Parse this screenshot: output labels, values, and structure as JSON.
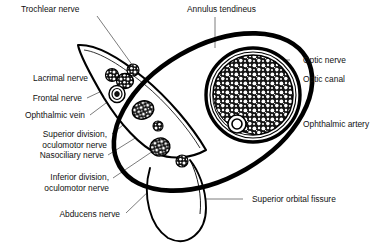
{
  "figure": {
    "type": "anatomical-cross-section-diagram",
    "colors": {
      "outline": "#000000",
      "leader_line": "#555555",
      "text": "#111111",
      "background": "#ffffff",
      "fill_stipple": "#1a1a1a"
    }
  },
  "labels": {
    "trochlear_nerve": "Trochlear nerve",
    "annulus_tendineus": "Annulus tendineus",
    "optic_nerve": "Optic nerve",
    "optic_canal": "Optic canal",
    "ophthalmic_artery": "Ophthalmic artery",
    "lacrimal_nerve": "Lacrimal nerve",
    "frontal_nerve": "Frontal nerve",
    "ophthalmic_vein": "Ophthalmic vein",
    "superior_division_oculomotor_line1": "Superior division,",
    "superior_division_oculomotor_line2": "oculomotor nerve",
    "nasociliary_nerve": "Nasociliary nerve",
    "inferior_division_oculomotor_line1": "Inferior division,",
    "inferior_division_oculomotor_line2": "oculomotor nerve",
    "abducens_nerve": "Abducens nerve",
    "superior_orbital_fissure": "Superior orbital fissure"
  },
  "structures": [
    {
      "name": "optic-nerve",
      "shape": "large-stippled-circle",
      "cx": 253,
      "cy": 95,
      "r": 41
    },
    {
      "name": "optic-canal",
      "shape": "ring-around-optic-nerve",
      "cx": 253,
      "cy": 95,
      "r": 47
    },
    {
      "name": "ophthalmic-artery",
      "shape": "small-double-circle",
      "cx": 237,
      "cy": 124,
      "r": 8
    },
    {
      "name": "annulus-tendineus",
      "shape": "thick-oval-ring",
      "cx": 210,
      "cy": 110
    },
    {
      "name": "superior-orbital-fissure",
      "shape": "tapering-pointed-horn",
      "tip_x": 78,
      "tip_y": 45
    },
    {
      "name": "inferior-orbital-fissure",
      "shape": "lobe-below-annulus",
      "cx": 175,
      "cy": 215
    },
    {
      "name": "trochlear-nerve-fascicle",
      "shape": "small-stippled-circle",
      "cx": 133,
      "cy": 70
    },
    {
      "name": "lacrimal-nerve-fascicle",
      "shape": "small-stippled-circle",
      "cx": 112,
      "cy": 75
    },
    {
      "name": "frontal-nerve-fascicle",
      "shape": "stippled-circle",
      "cx": 124,
      "cy": 80
    },
    {
      "name": "ophthalmic-vein-fascicle",
      "shape": "concentric-spiral-circle",
      "cx": 117,
      "cy": 93
    },
    {
      "name": "superior-division-oculomotor-fascicle",
      "shape": "stippled-oval",
      "cx": 142,
      "cy": 110
    },
    {
      "name": "nasociliary-fascicle",
      "shape": "tiny-stippled-circle",
      "cx": 157,
      "cy": 125
    },
    {
      "name": "inferior-division-oculomotor-fascicle",
      "shape": "stippled-circle",
      "cx": 160,
      "cy": 146
    },
    {
      "name": "abducens-nerve-fascicle",
      "shape": "small-stippled-circle",
      "cx": 181,
      "cy": 160
    }
  ]
}
